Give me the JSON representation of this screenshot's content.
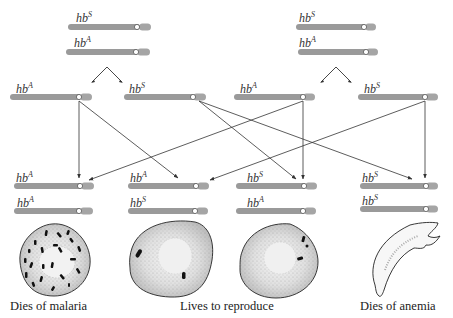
{
  "figure": {
    "type": "genetic cross diagram",
    "allele_prefix": "hb",
    "alleles": [
      "A",
      "S"
    ],
    "colors": {
      "chromosome": "#9a9a9a",
      "arrow": "#333333",
      "cell_outline": "#222222",
      "parasite": "#111111"
    }
  },
  "parents": [
    {
      "name": "parent-left",
      "chromosomes": [
        {
          "allele": "S"
        },
        {
          "allele": "A"
        }
      ]
    },
    {
      "name": "parent-right",
      "chromosomes": [
        {
          "allele": "S"
        },
        {
          "allele": "A"
        }
      ]
    }
  ],
  "gametes": [
    {
      "allele": "A",
      "from": "parent-left"
    },
    {
      "allele": "S",
      "from": "parent-left"
    },
    {
      "allele": "A",
      "from": "parent-right"
    },
    {
      "allele": "S",
      "from": "parent-right"
    }
  ],
  "offspring": [
    {
      "genotype": [
        "A",
        "A"
      ],
      "cell": "normal cell infected with many malaria parasites",
      "outcome": "Dies of malaria"
    },
    {
      "genotype": [
        "A",
        "S"
      ],
      "cell": "cell with few parasites",
      "outcome": ""
    },
    {
      "genotype": [
        "S",
        "A"
      ],
      "cell": "cell with few parasites",
      "outcome": ""
    },
    {
      "genotype": [
        "S",
        "S"
      ],
      "cell": "sickle cell",
      "outcome": "Dies of anemia"
    }
  ],
  "captions": {
    "malaria": "Dies of malaria",
    "reproduce": "Lives to reproduce",
    "anemia": "Dies of anemia"
  },
  "labels": {
    "hb": "hb",
    "A": "A",
    "S": "S"
  }
}
